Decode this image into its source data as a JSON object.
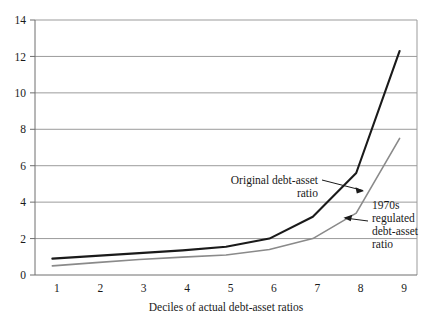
{
  "chart_data": {
    "type": "line",
    "title": "",
    "subtitle": "",
    "xlabel": "Deciles of actual debt-asset ratios",
    "ylabel": "",
    "x": [
      1,
      2,
      3,
      4,
      5,
      6,
      7,
      8,
      9
    ],
    "categories": [
      "1",
      "2",
      "3",
      "4",
      "5",
      "6",
      "7",
      "8",
      "9"
    ],
    "xtick_labels": [
      "1",
      "2",
      "3",
      "4",
      "5",
      "6",
      "7",
      "8",
      "9"
    ],
    "ytick_labels": [
      "0",
      "2",
      "4",
      "6",
      "8",
      "10",
      "12",
      "14"
    ],
    "yticks": [
      0,
      2,
      4,
      6,
      8,
      10,
      12,
      14
    ],
    "xlim": [
      0.6,
      9.4
    ],
    "ylim": [
      0,
      14
    ],
    "grid": "horizontal",
    "legend_position": "inline-annotations",
    "series": [
      {
        "name": "Original debt-asset ratio",
        "color": "#1a1a1a",
        "width": 2.1,
        "values": [
          0.9,
          1.05,
          1.2,
          1.35,
          1.55,
          2.0,
          3.2,
          5.6,
          12.3
        ]
      },
      {
        "name": "1970s regulated debt-asset ratio",
        "color": "#8a8a8a",
        "width": 1.6,
        "values": [
          0.5,
          0.68,
          0.85,
          0.98,
          1.1,
          1.4,
          2.0,
          3.4,
          7.5
        ]
      }
    ],
    "annotations": [
      {
        "id": "original-annotation",
        "lines": [
          "Original debt-asset",
          "ratio"
        ],
        "align": "right",
        "target_series": "Original debt-asset ratio"
      },
      {
        "id": "regulated-annotation",
        "lines": [
          "1970s",
          "regulated",
          "debt-asset",
          "ratio"
        ],
        "align": "left",
        "target_series": "1970s regulated debt-asset ratio"
      }
    ],
    "colors": {
      "original_line": "#1a1a1a",
      "regulated_line": "#8a8a8a",
      "gridline": "#9b9b9b",
      "axis": "#6e6e6e",
      "background": "#ffffff",
      "text": "#1a1a1a"
    }
  }
}
